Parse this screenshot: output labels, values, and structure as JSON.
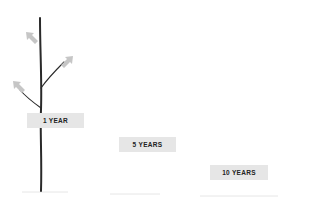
{
  "diagram": {
    "stages": [
      {
        "label": "1 YEAR",
        "box": {
          "x": 27,
          "y": 113,
          "w": 57
        }
      },
      {
        "label": "5 YEARS",
        "box": {
          "x": 119,
          "y": 137,
          "w": 57
        }
      },
      {
        "label": "10 YEARS",
        "box": {
          "x": 210,
          "y": 165,
          "w": 58
        }
      }
    ],
    "colors": {
      "background": "#ffffff",
      "trunk": "#2a2a2a",
      "arrow": "#c4c4c4",
      "label_bg": "#e6e6e6",
      "label_text": "#222222",
      "ground": "#e8e8e8"
    },
    "icons": {
      "growth_arrow": "arrow-up-left / arrow-up-right (light gray)"
    }
  }
}
